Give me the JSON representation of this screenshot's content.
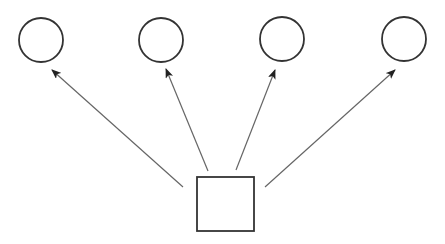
{
  "diagram": {
    "width": 445,
    "height": 244,
    "colors": {
      "background": "#ffffff",
      "shape_stroke": "#333333",
      "arrow_stroke": "#666666",
      "arrow_head": "#222222"
    },
    "source": {
      "id": "square",
      "shape": "square",
      "x": 197,
      "y": 177,
      "width": 57,
      "height": 54
    },
    "targets": [
      {
        "id": "circle-1",
        "shape": "circle",
        "cx": 41,
        "cy": 40,
        "r": 22
      },
      {
        "id": "circle-2",
        "shape": "circle",
        "cx": 161,
        "cy": 40,
        "r": 22
      },
      {
        "id": "circle-3",
        "shape": "circle",
        "cx": 282,
        "cy": 39,
        "r": 22
      },
      {
        "id": "circle-4",
        "shape": "circle",
        "cx": 404,
        "cy": 39,
        "r": 22
      }
    ],
    "edges": [
      {
        "from": "square",
        "to": "circle-1",
        "x1": 183,
        "y1": 187,
        "x2": 52,
        "y2": 70
      },
      {
        "from": "square",
        "to": "circle-2",
        "x1": 208,
        "y1": 171,
        "x2": 166,
        "y2": 69
      },
      {
        "from": "square",
        "to": "circle-3",
        "x1": 236,
        "y1": 170,
        "x2": 275,
        "y2": 70
      },
      {
        "from": "square",
        "to": "circle-4",
        "x1": 265,
        "y1": 187,
        "x2": 395,
        "y2": 70
      }
    ]
  }
}
